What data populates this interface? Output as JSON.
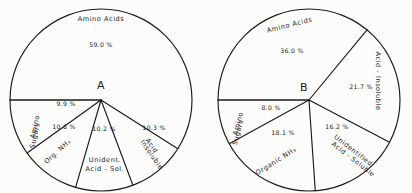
{
  "figure": {
    "background_color": "#fcfcfa",
    "ink_color": "#1a1a1a"
  },
  "chart_data": [
    {
      "type": "pie",
      "title": "A",
      "label": "A",
      "center": [
        101,
        100
      ],
      "radius": 91,
      "start_angle_deg": 180,
      "direction": "counterclockwise-from-left",
      "categories": [
        "Amino Acids",
        "Acid Insoluble",
        "Unident. Acid-Sol.",
        "Org. NH3",
        "Amino Sugars"
      ],
      "values": [
        59.0,
        10.3,
        10.2,
        10.6,
        9.9
      ],
      "value_labels": [
        "59.0 %",
        "10.3 %",
        "10.2 %",
        "10.6 %",
        "9.9 %"
      ],
      "legend": "none",
      "grid": false,
      "slices": [
        {
          "name": "Amino Acids",
          "value": 59.0,
          "value_label": "59.0 %",
          "name_x": 101,
          "name_y": 21,
          "name_rotate": 0,
          "val_x": 101,
          "val_y": 47,
          "val_rotate": 0,
          "name_anchor": "middle",
          "multiline": false,
          "line2": ""
        },
        {
          "name": "Acid",
          "line2": "Insoluble",
          "value": 10.3,
          "value_label": "10.3 %",
          "name_x": 150,
          "name_y": 147,
          "name_rotate": 55,
          "val_x": 154,
          "val_y": 130,
          "val_rotate": 0,
          "name_anchor": "middle",
          "multiline": true
        },
        {
          "name": "Unident.",
          "line2": "Acid - Sol.",
          "value": 10.2,
          "value_label": "10.2 %",
          "name_x": 105,
          "name_y": 162,
          "name_rotate": 0,
          "val_x": 104,
          "val_y": 131,
          "val_rotate": 0,
          "name_anchor": "middle",
          "multiline": true
        },
        {
          "name": "Org.  NH3",
          "line2": "",
          "value": 10.6,
          "value_label": "10.6 %",
          "name_x": 59,
          "name_y": 153,
          "name_rotate": -42,
          "val_x": 64,
          "val_y": 129,
          "val_rotate": 0,
          "name_anchor": "middle",
          "multiline": false
        },
        {
          "name": "Amino",
          "line2": "Sugars",
          "value": 9.9,
          "value_label": "9.9 %",
          "name_x": 37,
          "name_y": 127,
          "name_rotate": -78,
          "val_x": 66,
          "val_y": 106,
          "val_rotate": 0,
          "name_anchor": "middle",
          "multiline": true
        }
      ],
      "letter_x": 101,
      "letter_y": 89
    },
    {
      "type": "pie",
      "title": "B",
      "label": "B",
      "center": [
        309,
        100
      ],
      "radius": 91,
      "start_angle_deg": 180,
      "direction": "counterclockwise-from-left",
      "categories": [
        "Amino Acids",
        "Acid-Insoluble",
        "Unidentified Acid-Soluble",
        "Organic NH3",
        "Amino Sugars"
      ],
      "values": [
        36.0,
        21.7,
        16.2,
        18.1,
        8.0
      ],
      "value_labels": [
        "36.0 %",
        "21.7 %",
        "16.2 %",
        "18.1 %",
        "8.0 %"
      ],
      "legend": "none",
      "grid": false,
      "slices": [
        {
          "name": "Amino  Acids",
          "line2": "",
          "value": 36.0,
          "value_label": "36.0 %",
          "name_x": 290,
          "name_y": 27,
          "name_rotate": -14,
          "val_x": 292,
          "val_y": 53,
          "val_rotate": 0,
          "name_anchor": "middle",
          "multiline": false
        },
        {
          "name": "Acid - Insoluble",
          "line2": "",
          "value": 21.7,
          "value_label": "21.7 %",
          "name_x": 376,
          "name_y": 81,
          "name_rotate": 90,
          "val_x": 361,
          "val_y": 89,
          "val_rotate": 0,
          "name_anchor": "middle",
          "multiline": true
        },
        {
          "name": "Unidentified",
          "line2": "Acid - Soluble",
          "value": 16.2,
          "value_label": "16.2 %",
          "name_x": 352,
          "name_y": 152,
          "name_rotate": 38,
          "val_x": 337,
          "val_y": 129,
          "val_rotate": 0,
          "name_anchor": "middle",
          "multiline": true
        },
        {
          "name": "Organic  NH3",
          "line2": "",
          "value": 18.1,
          "value_label": "18.1 %",
          "name_x": 277,
          "name_y": 163,
          "name_rotate": -32,
          "val_x": 283,
          "val_y": 135,
          "val_rotate": 0,
          "name_anchor": "middle",
          "multiline": false
        },
        {
          "name": "Amino",
          "line2": "Sugars",
          "value": 8.0,
          "value_label": "8.0 %",
          "name_x": 240,
          "name_y": 124,
          "name_rotate": -75,
          "val_x": 271,
          "val_y": 110,
          "val_rotate": 0,
          "name_anchor": "middle",
          "multiline": true
        }
      ],
      "letter_x": 304,
      "letter_y": 91
    }
  ]
}
